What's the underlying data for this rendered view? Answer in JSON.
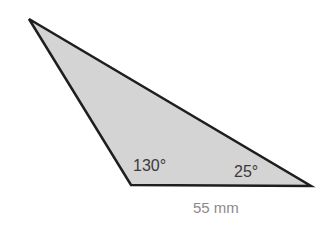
{
  "diagram": {
    "shape": "triangle",
    "fill_color": "#d4d4d4",
    "stroke_color": "#1e1e1e",
    "vertices": [
      [
        29,
        19
      ],
      [
        131,
        185
      ],
      [
        311,
        186
      ]
    ],
    "angles": [
      {
        "vertex": "bottom-left",
        "label": "130°"
      },
      {
        "vertex": "bottom-right",
        "label": "25°"
      }
    ],
    "sides": [
      {
        "side": "bottom",
        "label": "55 mm"
      }
    ]
  }
}
